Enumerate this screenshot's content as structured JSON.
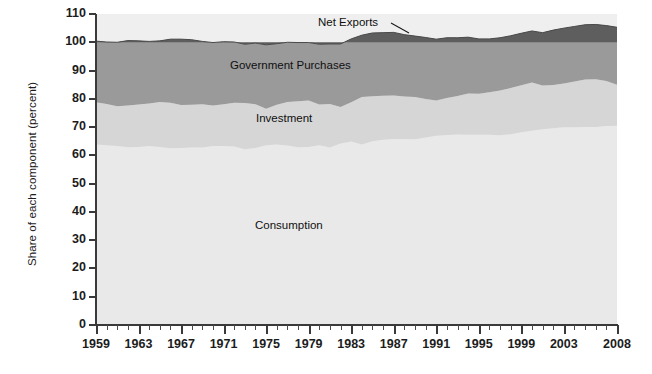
{
  "chart_data": {
    "type": "area",
    "stacked": true,
    "title": "",
    "subtitle": "",
    "xlabel": "",
    "ylabel": "Share of each component (percent)",
    "xlim": [
      1959,
      2008
    ],
    "ylim": [
      0,
      110
    ],
    "ytick_step": 10,
    "yticks": [
      0,
      10,
      20,
      30,
      40,
      50,
      60,
      70,
      80,
      90,
      100,
      110
    ],
    "xticks": [
      1959,
      1963,
      1967,
      1971,
      1975,
      1979,
      1983,
      1987,
      1991,
      1995,
      1999,
      2003,
      2008
    ],
    "x_minor_tick_every": 1,
    "grid": false,
    "legend_position": "in-plot-annotations",
    "annotations": [
      {
        "text": "Net Exports",
        "series": "Net Exports",
        "leader_line": true
      },
      {
        "text": "Government Purchases",
        "series": "Government Purchases",
        "leader_line": false
      },
      {
        "text": "Investment",
        "series": "Investment",
        "leader_line": false
      },
      {
        "text": "Consumption",
        "series": "Consumption",
        "leader_line": false
      }
    ],
    "colors": {
      "consumption": "#e9e9e9",
      "investment": "#d6d6d6",
      "government": "#9a9a9a",
      "net_exports": "#5e5e5e",
      "plot_background": "#efefef",
      "axis": "#3a3a3a",
      "text": "#1c1c1c"
    },
    "x": [
      1959,
      1960,
      1961,
      1962,
      1963,
      1964,
      1965,
      1966,
      1967,
      1968,
      1969,
      1970,
      1971,
      1972,
      1973,
      1974,
      1975,
      1976,
      1977,
      1978,
      1979,
      1980,
      1981,
      1982,
      1983,
      1984,
      1985,
      1986,
      1987,
      1988,
      1989,
      1990,
      1991,
      1992,
      1993,
      1994,
      1995,
      1996,
      1997,
      1998,
      1999,
      2000,
      2001,
      2002,
      2003,
      2004,
      2005,
      2006,
      2007,
      2008
    ],
    "series": [
      {
        "name": "Consumption",
        "values": [
          63.8,
          63.6,
          63.3,
          62.9,
          63.0,
          63.3,
          63.0,
          62.5,
          62.6,
          62.8,
          62.8,
          63.3,
          63.3,
          63.1,
          62.2,
          62.6,
          63.6,
          63.8,
          63.5,
          62.9,
          63.0,
          63.6,
          62.8,
          64.2,
          64.9,
          63.8,
          65.0,
          65.5,
          65.8,
          65.8,
          65.7,
          66.3,
          66.9,
          67.2,
          67.4,
          67.3,
          67.3,
          67.3,
          67.1,
          67.5,
          68.2,
          68.7,
          69.2,
          69.6,
          69.9,
          69.9,
          70.0,
          70.0,
          70.4,
          70.5
        ]
      },
      {
        "name": "Investment",
        "values": [
          15.0,
          14.6,
          14.1,
          14.7,
          15.0,
          15.0,
          15.9,
          16.1,
          15.2,
          15.1,
          15.3,
          14.3,
          14.8,
          15.5,
          16.3,
          15.5,
          12.9,
          14.1,
          15.4,
          16.2,
          16.4,
          14.4,
          15.4,
          12.9,
          13.9,
          16.8,
          15.9,
          15.6,
          15.4,
          15.0,
          14.9,
          13.6,
          12.5,
          13.1,
          13.6,
          14.6,
          14.5,
          15.0,
          15.8,
          16.3,
          16.6,
          17.1,
          15.5,
          15.3,
          15.5,
          16.2,
          16.8,
          16.9,
          15.9,
          14.5
        ]
      },
      {
        "name": "Government Purchases",
        "values": [
          21.6,
          21.9,
          22.6,
          23.0,
          22.5,
          22.0,
          21.6,
          22.5,
          23.3,
          23.0,
          22.2,
          22.3,
          22.1,
          21.5,
          20.8,
          21.6,
          22.6,
          21.6,
          21.1,
          20.8,
          20.5,
          21.3,
          21.2,
          22.3,
          22.4,
          21.9,
          22.4,
          22.3,
          22.3,
          21.9,
          21.6,
          21.8,
          21.7,
          21.3,
          20.6,
          19.9,
          19.4,
          18.9,
          18.7,
          18.5,
          18.4,
          18.2,
          18.7,
          19.4,
          19.6,
          19.5,
          19.4,
          19.4,
          19.6,
          20.3
        ]
      },
      {
        "name": "Net Exports",
        "values": [
          0.1,
          0.5,
          0.6,
          0.4,
          0.5,
          0.8,
          0.6,
          0.3,
          0.3,
          0.1,
          0.1,
          0.2,
          -0.3,
          -0.4,
          0.5,
          0.3,
          1.0,
          0.4,
          -0.6,
          -0.6,
          -0.2,
          0.0,
          -0.2,
          -0.3,
          -1.0,
          -2.3,
          -2.8,
          -3.2,
          -3.1,
          -2.3,
          -1.7,
          -1.3,
          -0.8,
          -1.0,
          -1.5,
          -1.7,
          -1.2,
          -1.2,
          -1.5,
          -2.2,
          -3.1,
          -3.9,
          -3.6,
          -4.2,
          -4.7,
          -5.4,
          -5.9,
          -5.9,
          -5.1,
          -4.9
        ]
      }
    ]
  },
  "boundaries": {
    "consumption_top": [
      63.8,
      63.6,
      63.3,
      62.9,
      63.0,
      63.3,
      63.0,
      62.5,
      62.6,
      62.8,
      62.8,
      63.3,
      63.3,
      63.1,
      62.2,
      62.6,
      63.6,
      63.8,
      63.5,
      62.9,
      63.0,
      63.6,
      62.8,
      64.2,
      64.9,
      63.8,
      65.0,
      65.5,
      65.8,
      65.8,
      65.7,
      66.3,
      66.9,
      67.2,
      67.4,
      67.3,
      67.3,
      67.3,
      67.1,
      67.5,
      68.2,
      68.7,
      69.2,
      69.6,
      69.9,
      69.9,
      70.0,
      70.0,
      70.4,
      70.5
    ],
    "investment_top": [
      78.8,
      78.2,
      77.4,
      77.6,
      78.0,
      78.3,
      78.9,
      78.6,
      77.8,
      77.9,
      78.1,
      77.6,
      78.1,
      78.6,
      78.5,
      78.1,
      76.5,
      77.9,
      78.9,
      79.1,
      79.4,
      78.0,
      78.2,
      77.1,
      78.8,
      80.6,
      80.9,
      81.1,
      81.2,
      80.8,
      80.6,
      79.9,
      79.4,
      80.3,
      81.0,
      81.9,
      81.8,
      82.3,
      82.9,
      83.8,
      84.8,
      85.8,
      84.7,
      84.9,
      85.4,
      86.1,
      86.8,
      86.9,
      86.3,
      85.0
    ],
    "government_top": [
      100.4,
      100.1,
      100.0,
      100.6,
      100.5,
      100.3,
      100.5,
      101.1,
      101.1,
      100.9,
      100.3,
      99.9,
      100.2,
      100.1,
      99.3,
      99.7,
      99.1,
      99.5,
      100.0,
      99.9,
      99.9,
      99.3,
      99.4,
      99.4,
      101.2,
      102.5,
      103.3,
      103.4,
      103.5,
      102.7,
      102.2,
      101.7,
      101.1,
      101.6,
      101.6,
      101.8,
      101.2,
      101.2,
      101.6,
      102.3,
      103.2,
      104.0,
      103.4,
      104.3,
      105.0,
      105.6,
      106.2,
      106.3,
      105.9,
      105.3
    ]
  },
  "labels": {
    "net_exports": "Net Exports",
    "government_purchases": "Government Purchases",
    "investment": "Investment",
    "consumption": "Consumption"
  }
}
